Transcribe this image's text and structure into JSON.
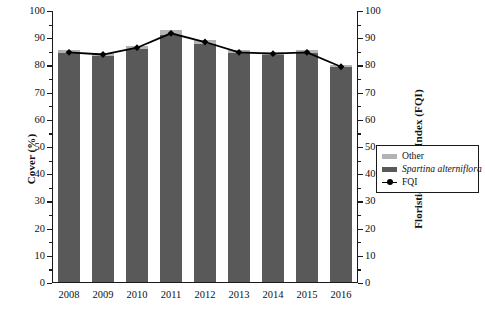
{
  "figure": {
    "background": "#ffffff",
    "width": 485,
    "height": 317
  },
  "axes": {
    "y_left": {
      "label": "Cover (%)",
      "min": 0,
      "max": 100,
      "ticks": [
        0,
        10,
        20,
        30,
        40,
        50,
        60,
        70,
        80,
        90,
        100
      ],
      "tick_labels": [
        "0",
        "10",
        "20",
        "30",
        "40",
        "50",
        "60",
        "70",
        "80",
        "90",
        "100"
      ]
    },
    "y_right": {
      "label": "Floristic Quality Index (FQI)",
      "min": 0,
      "max": 100,
      "ticks": [
        0,
        10,
        20,
        30,
        40,
        50,
        60,
        70,
        80,
        90,
        100
      ],
      "tick_labels": [
        "0",
        "10",
        "20",
        "30",
        "40",
        "50",
        "60",
        "70",
        "80",
        "90",
        "100"
      ]
    },
    "x": {
      "label": "",
      "categories": [
        "2008",
        "2009",
        "2010",
        "2011",
        "2012",
        "2013",
        "2014",
        "2015",
        "2016"
      ]
    }
  },
  "legend": {
    "position": "right-middle",
    "items": [
      {
        "label": "Other",
        "type": "swatch",
        "color": "#b3b3b3",
        "italic": false
      },
      {
        "label": "Spartina alterniflora",
        "type": "swatch",
        "color": "#595959",
        "italic": true
      },
      {
        "label": "FQI",
        "type": "line-marker",
        "color": "#000000",
        "italic": false
      }
    ]
  },
  "colors": {
    "other": "#b3b3b3",
    "spartina": "#595959",
    "fqi_line": "#000000",
    "axis": "#1a1a1a"
  },
  "chart_data": {
    "type": "bar",
    "title": "",
    "xlabel": "",
    "ylabel": "Cover (%)",
    "y2label": "Floristic Quality Index (FQI)",
    "ylim": [
      0,
      100
    ],
    "y2lim": [
      0,
      100
    ],
    "grid": false,
    "stacked": true,
    "legend_position": "right-middle",
    "categories": [
      "2008",
      "2009",
      "2010",
      "2011",
      "2012",
      "2013",
      "2014",
      "2015",
      "2016"
    ],
    "series": [
      {
        "name": "Spartina alterniflora",
        "axis": "left",
        "kind": "bar",
        "color": "#595959",
        "values": [
          84.0,
          83.0,
          85.5,
          90.5,
          87.5,
          84.0,
          83.5,
          84.0,
          79.0
        ]
      },
      {
        "name": "Other",
        "axis": "left",
        "kind": "bar",
        "color": "#b3b3b3",
        "values": [
          1.0,
          1.0,
          1.0,
          2.0,
          1.5,
          1.0,
          1.0,
          1.0,
          0.5
        ]
      },
      {
        "name": "FQI",
        "axis": "right",
        "kind": "line",
        "color": "#000000",
        "marker": "filled-diamond",
        "values": [
          84.8,
          84.0,
          86.5,
          91.8,
          88.6,
          84.8,
          84.3,
          84.8,
          79.5
        ]
      }
    ],
    "totals_cover": [
      85.0,
      84.0,
      86.5,
      92.5,
      89.0,
      85.0,
      84.5,
      85.0,
      79.5
    ]
  }
}
